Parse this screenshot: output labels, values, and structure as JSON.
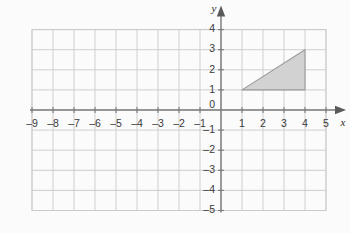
{
  "chart_data": {
    "type": "scatter",
    "title": "",
    "xlabel": "x",
    "ylabel": "y",
    "xlim": [
      -9,
      5
    ],
    "ylim": [
      -5,
      4
    ],
    "grid": true,
    "legend": null,
    "x_ticks": [
      -9,
      -8,
      -7,
      -6,
      -5,
      -4,
      -3,
      -2,
      -1,
      1,
      2,
      3,
      4,
      5
    ],
    "y_ticks": [
      4,
      3,
      2,
      1,
      -1,
      -2,
      -3,
      -4,
      -5
    ],
    "x_tick_labels": [
      "–9",
      "–8",
      "–7",
      "–6",
      "–5",
      "–4",
      "–3",
      "–2",
      "–1",
      "1",
      "2",
      "3",
      "4",
      "5"
    ],
    "y_tick_labels": [
      "4",
      "3",
      "2",
      "1",
      "–1",
      "–2",
      "–3",
      "–4",
      "–5"
    ],
    "origin_label": "0",
    "shapes": [
      {
        "name": "shaded-triangle",
        "kind": "polygon",
        "vertices": [
          [
            1,
            1
          ],
          [
            4,
            1
          ],
          [
            4,
            3
          ]
        ],
        "fill": "#d2d2d2",
        "stroke": "#9a9a9a"
      }
    ],
    "annotations": []
  },
  "axes": {
    "x_axis_label": "x",
    "y_axis_label": "y",
    "origin_label": "0",
    "x_arrow": "arrow-right",
    "y_arrow": "arrow-up"
  },
  "colors": {
    "background": "#fbfbfb",
    "grid": "#c9c9c9",
    "axis": "#7a7a7a",
    "shape_fill": "#d2d2d2",
    "shape_stroke": "#9a9a9a",
    "text": "#3a3a3a"
  },
  "geometry": {
    "origin_px": [
      221,
      110
    ],
    "cell_w_px": 21,
    "cell_h_px": 20.1,
    "grid_left_px": 32,
    "grid_right_px": 326,
    "grid_top_px": 29,
    "grid_bottom_px": 210
  }
}
